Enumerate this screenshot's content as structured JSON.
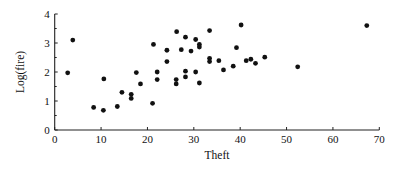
{
  "chart_data": {
    "type": "scatter",
    "title": "",
    "xlabel": "Theft",
    "ylabel": "Log(fire)",
    "xlim": [
      0,
      70
    ],
    "ylim": [
      0,
      4
    ],
    "xticks": [
      0,
      10,
      20,
      30,
      40,
      50,
      60,
      70
    ],
    "yticks": [
      0,
      1,
      2,
      3,
      4
    ],
    "y_minor_ticks": [
      0.5,
      1.5,
      2.5,
      3.5
    ],
    "grid": false,
    "legend": null,
    "marker": {
      "shape": "circle",
      "color": "#111111"
    },
    "series": [
      {
        "name": "observations",
        "points": [
          {
            "x": 2.8,
            "y": 1.97
          },
          {
            "x": 3.9,
            "y": 3.1
          },
          {
            "x": 8.4,
            "y": 0.78
          },
          {
            "x": 10.5,
            "y": 0.68
          },
          {
            "x": 10.6,
            "y": 1.76
          },
          {
            "x": 13.5,
            "y": 0.81
          },
          {
            "x": 14.5,
            "y": 1.3
          },
          {
            "x": 16.5,
            "y": 1.23
          },
          {
            "x": 16.5,
            "y": 1.09
          },
          {
            "x": 17.6,
            "y": 1.98
          },
          {
            "x": 18.5,
            "y": 1.59
          },
          {
            "x": 21.1,
            "y": 0.92
          },
          {
            "x": 21.3,
            "y": 2.95
          },
          {
            "x": 22.1,
            "y": 2.0
          },
          {
            "x": 22.1,
            "y": 1.74
          },
          {
            "x": 24.2,
            "y": 2.75
          },
          {
            "x": 24.2,
            "y": 2.36
          },
          {
            "x": 26.2,
            "y": 1.74
          },
          {
            "x": 26.2,
            "y": 1.59
          },
          {
            "x": 26.3,
            "y": 3.39
          },
          {
            "x": 27.3,
            "y": 2.77
          },
          {
            "x": 28.2,
            "y": 3.2
          },
          {
            "x": 28.2,
            "y": 2.03
          },
          {
            "x": 28.2,
            "y": 1.83
          },
          {
            "x": 29.4,
            "y": 2.72
          },
          {
            "x": 30.4,
            "y": 3.12
          },
          {
            "x": 30.4,
            "y": 2.0
          },
          {
            "x": 31.2,
            "y": 2.95
          },
          {
            "x": 31.2,
            "y": 2.86
          },
          {
            "x": 31.2,
            "y": 1.62
          },
          {
            "x": 33.4,
            "y": 3.43
          },
          {
            "x": 33.4,
            "y": 2.47
          },
          {
            "x": 33.4,
            "y": 2.36
          },
          {
            "x": 35.4,
            "y": 2.39
          },
          {
            "x": 36.4,
            "y": 2.07
          },
          {
            "x": 38.5,
            "y": 2.2
          },
          {
            "x": 39.2,
            "y": 2.84
          },
          {
            "x": 40.2,
            "y": 3.62
          },
          {
            "x": 41.3,
            "y": 2.39
          },
          {
            "x": 42.3,
            "y": 2.44
          },
          {
            "x": 43.3,
            "y": 2.3
          },
          {
            "x": 45.3,
            "y": 2.51
          },
          {
            "x": 52.4,
            "y": 2.18
          },
          {
            "x": 67.3,
            "y": 3.6
          }
        ]
      }
    ]
  },
  "layout": {
    "plot_left": 54.7,
    "plot_right": 379.3,
    "plot_top": 14,
    "plot_bottom": 130,
    "point_radius": 2.4,
    "axis_color": "#222222"
  }
}
